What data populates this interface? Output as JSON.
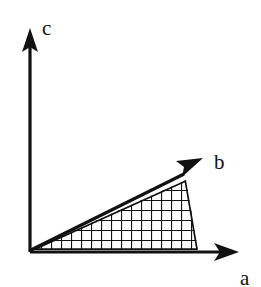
{
  "figure": {
    "background_color": "#ffffff",
    "stroke_color": "#111111",
    "width": 261,
    "height": 287
  },
  "axes": [
    {
      "id": "c",
      "label": "c",
      "direction": "up",
      "origin": {
        "x": 30,
        "y": 252
      },
      "tip": {
        "x": 30,
        "y": 30
      },
      "label_position": {
        "x": 42,
        "y": 18
      }
    },
    {
      "id": "b",
      "label": "b",
      "direction": "up-right-diagonal",
      "origin": {
        "x": 30,
        "y": 252
      },
      "tip": {
        "x": 201,
        "y": 159
      },
      "label_position": {
        "x": 214,
        "y": 152
      }
    },
    {
      "id": "a",
      "label": "a",
      "direction": "right",
      "origin": {
        "x": 30,
        "y": 252
      },
      "tip": {
        "x": 238,
        "y": 252
      },
      "label_position": {
        "x": 240,
        "y": 268
      },
      "label_clipped": "bottom edge"
    }
  ],
  "region": {
    "name": "cross-hatched-triangle",
    "fill_pattern": "grid-crosshatch",
    "pattern_cell_size": 10,
    "pattern_line_width": 2,
    "pattern_color": "#111111",
    "fill_color": "#ffffff",
    "outline_color": "#111111",
    "outline_width": 3,
    "vertices": [
      {
        "x": 31,
        "y": 250
      },
      {
        "x": 186,
        "y": 180
      },
      {
        "x": 198,
        "y": 250
      }
    ]
  },
  "arrowheads": {
    "style": "solid-filled-triangle",
    "color": "#111111",
    "length": 22,
    "half_width": 9
  }
}
